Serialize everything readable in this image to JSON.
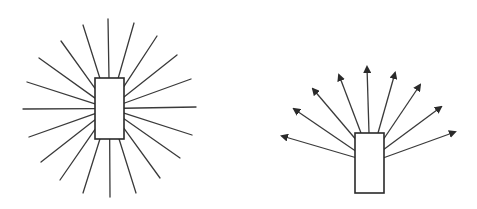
{
  "figures": [
    {
      "name": "omnidirectional-radiation",
      "description": "Rectangle with lines radiating in all directions",
      "rect": {
        "x": 95,
        "y": 78,
        "w": 29,
        "h": 61
      },
      "center": [
        109.5,
        108.5
      ],
      "rays": [
        [
          108,
          19
        ],
        [
          83,
          25
        ],
        [
          134,
          23
        ],
        [
          61,
          41
        ],
        [
          157,
          36
        ],
        [
          39,
          58
        ],
        [
          177,
          55
        ],
        [
          27,
          82
        ],
        [
          191,
          79
        ],
        [
          23,
          109
        ],
        [
          196,
          107
        ],
        [
          29,
          137
        ],
        [
          192,
          135
        ],
        [
          41,
          162
        ],
        [
          180,
          158
        ],
        [
          60,
          180
        ],
        [
          160,
          178
        ],
        [
          83,
          193
        ],
        [
          136,
          193
        ],
        [
          110,
          197
        ]
      ],
      "stroke": "#3a3a3a"
    },
    {
      "name": "directional-radiation",
      "description": "Rectangle with arrows fanning upward",
      "rect": {
        "x": 355,
        "y": 133,
        "w": 29,
        "h": 60
      },
      "arrows": [
        {
          "from": [
            357,
            158
          ],
          "to": [
            282,
            136
          ]
        },
        {
          "from": [
            357,
            152
          ],
          "to": [
            294,
            109
          ]
        },
        {
          "from": [
            358,
            142
          ],
          "to": [
            313,
            89
          ]
        },
        {
          "from": [
            361,
            133
          ],
          "to": [
            339,
            75
          ]
        },
        {
          "from": [
            369,
            133
          ],
          "to": [
            367,
            67
          ]
        },
        {
          "from": [
            378,
            133
          ],
          "to": [
            395,
            73
          ]
        },
        {
          "from": [
            383,
            140
          ],
          "to": [
            420,
            85
          ]
        },
        {
          "from": [
            383,
            150
          ],
          "to": [
            441,
            107
          ]
        },
        {
          "from": [
            383,
            158
          ],
          "to": [
            455,
            132
          ]
        }
      ],
      "stroke": "#3a3a3a"
    }
  ]
}
